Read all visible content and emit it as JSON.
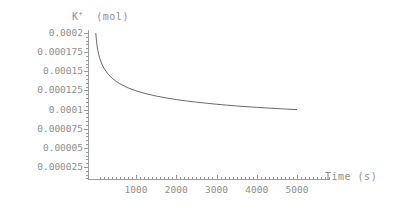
{
  "chart_data": {
    "type": "line",
    "title_base": "K",
    "title_sup": "+",
    "title_unit": "(mol)",
    "xlabel": "Time (s)",
    "ylabel": "K+ (mol)",
    "xlim": [
      0,
      5400
    ],
    "ylim": [
      0,
      0.000207
    ],
    "grid": false,
    "legend": "none",
    "line_color": "#6b6b6b",
    "axis_color": "#9a9a9a",
    "xticks": [
      1000,
      2000,
      3000,
      4000,
      5000
    ],
    "xtick_labels": [
      "1000",
      "2000",
      "3000",
      "4000",
      "5000"
    ],
    "yticks": [
      2.5e-05,
      5e-05,
      7.5e-05,
      0.0001,
      0.000125,
      0.00015,
      0.000175,
      0.0002
    ],
    "ytick_labels": [
      "0.000025",
      "0.00005",
      "0.000075",
      "0.0001",
      "0.000125",
      "0.00015",
      "0.000175",
      "0.0002"
    ],
    "x": [
      0,
      25,
      50,
      75,
      100,
      150,
      200,
      300,
      400,
      500,
      600,
      800,
      1000,
      1250,
      1500,
      1750,
      2000,
      2250,
      2500,
      2750,
      3000,
      3250,
      3500,
      3750,
      4000,
      4250,
      4500,
      4750,
      5000
    ],
    "values": [
      0.0002,
      0.000186,
      0.0001775,
      0.0001715,
      0.0001668,
      0.0001596,
      0.0001543,
      0.0001466,
      0.0001412,
      0.000137,
      0.0001336,
      0.0001284,
      0.0001245,
      0.0001207,
      0.0001177,
      0.0001152,
      0.0001131,
      0.0001113,
      0.0001097,
      0.0001083,
      0.000107,
      0.0001058,
      0.0001047,
      0.0001038,
      0.0001029,
      0.0001021,
      0.0001013,
      0.0001006,
      0.0001
    ],
    "series_name": "K+ concentration"
  }
}
